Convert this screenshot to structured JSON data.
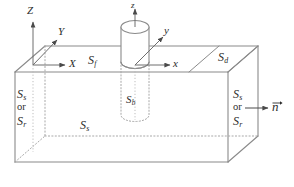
{
  "figure": {
    "line_color": "#8a8a8a",
    "hidden_line_color": "#a8a8a8",
    "text_color": "#2b2b2b"
  },
  "global_axes": {
    "z_label": "Z",
    "y_label": "Y",
    "x_label": "X"
  },
  "local_axes": {
    "z_label": "z",
    "y_label": "y",
    "x_label": "x"
  },
  "surfaces": {
    "free_surface": {
      "symbol": "S",
      "subscript": "f"
    },
    "dashpot_surface": {
      "symbol": "S",
      "subscript": "d"
    },
    "soil_body": {
      "symbol": "S",
      "subscript": "s"
    },
    "pile_surface": {
      "symbol": "S",
      "subscript": "b"
    },
    "left_face_primary": {
      "symbol": "S",
      "subscript": "s"
    },
    "left_face_conjunction": "or",
    "left_face_secondary": {
      "symbol": "S",
      "subscript": "r"
    },
    "right_face_primary": {
      "symbol": "S",
      "subscript": "s"
    },
    "right_face_conjunction": "or",
    "right_face_secondary": {
      "symbol": "S",
      "subscript": "r"
    }
  },
  "normal_vector": {
    "label": "n"
  }
}
